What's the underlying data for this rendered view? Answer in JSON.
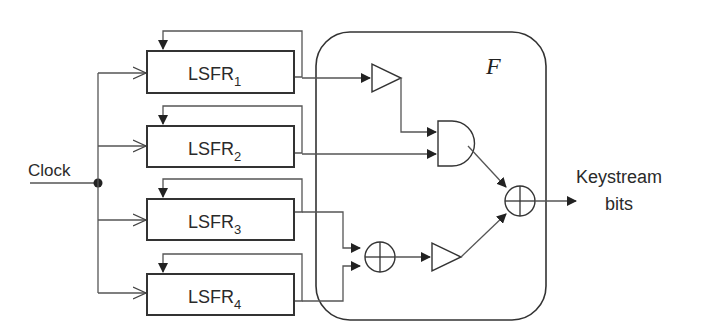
{
  "diagram": {
    "input_label": "Clock",
    "function_label": "F",
    "output_label_line1": "Keystream",
    "output_label_line2": "bits",
    "registers": [
      {
        "name": "LSFR",
        "sub": "1"
      },
      {
        "name": "LSFR",
        "sub": "2"
      },
      {
        "name": "LSFR",
        "sub": "3"
      },
      {
        "name": "LSFR",
        "sub": "4"
      }
    ],
    "gates": [
      {
        "type": "NOT",
        "input": "LSFR1"
      },
      {
        "type": "AND",
        "inputs": [
          "NOT(LSFR1)",
          "LSFR2"
        ]
      },
      {
        "type": "XOR",
        "inputs": [
          "LSFR3",
          "LSFR4"
        ]
      },
      {
        "type": "NOT",
        "input": "XOR(LSFR3,LSFR4)"
      },
      {
        "type": "XOR",
        "inputs": [
          "AND",
          "NOT"
        ],
        "output": "Keystream bits"
      }
    ]
  }
}
